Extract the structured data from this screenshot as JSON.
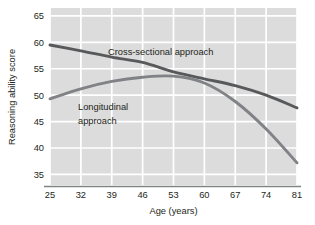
{
  "chart_data": {
    "type": "line",
    "title": "",
    "xlabel": "Age (years)",
    "ylabel": "Reasoning ability score",
    "xlim": [
      25,
      81
    ],
    "ylim": [
      33,
      66.5
    ],
    "xticks": [
      25,
      32,
      39,
      46,
      53,
      60,
      67,
      74,
      81
    ],
    "yticks": [
      35,
      40,
      45,
      50,
      55,
      60,
      65
    ],
    "xtick_labels": [
      "25",
      "32",
      "39",
      "46",
      "53",
      "60",
      "67",
      "74",
      "81"
    ],
    "ytick_labels": [
      "65",
      "60",
      "55",
      "50",
      "45",
      "40",
      "35"
    ],
    "grid": true,
    "grid_color": "#ffffff",
    "plot_background": "#dcdcdc",
    "legend": "inline-annotations",
    "series": [
      {
        "name": "Cross-sectional approach",
        "label": "Cross-sectional approach",
        "color": "#58595b",
        "x": [
          25,
          32,
          39,
          46,
          53,
          60,
          67,
          74,
          81
        ],
        "values": [
          59.5,
          58.4,
          57.2,
          56.2,
          54.4,
          53.1,
          51.8,
          50.0,
          47.6
        ]
      },
      {
        "name": "Longitudinal approach",
        "label": "Longitudinal approach",
        "color": "#808285",
        "x": [
          25,
          32,
          39,
          46,
          53,
          60,
          67,
          74,
          81
        ],
        "values": [
          49.3,
          51.2,
          52.6,
          53.4,
          53.6,
          52.3,
          48.8,
          43.6,
          37.2
        ]
      }
    ],
    "annotations": [
      {
        "text": "Cross-sectional approach",
        "series": "Cross-sectional approach",
        "x_px": 108,
        "y_px": 55
      },
      {
        "text": "Longitudinal",
        "series": "Longitudinal approach",
        "x_px": 78,
        "y_px": 110
      },
      {
        "text": "approach",
        "series": "Longitudinal approach",
        "x_px": 78,
        "y_px": 124
      }
    ]
  }
}
